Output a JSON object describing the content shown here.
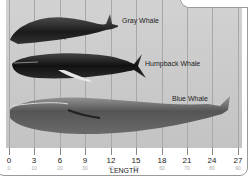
{
  "diagram": {
    "axis": {
      "title": "LENGTH",
      "meters": [
        "0",
        "3",
        "6",
        "9",
        "12",
        "15",
        "18",
        "21",
        "24",
        "27"
      ],
      "feet": [
        "0",
        "10",
        "20",
        "30",
        "40",
        "50",
        "60",
        "70",
        "80",
        "90"
      ]
    },
    "whales": [
      {
        "name": "Gray Whale",
        "approx_length_m": 14
      },
      {
        "name": "Humpback Whale",
        "approx_length_m": 16
      },
      {
        "name": "Blue Whale",
        "approx_length_m": 27
      }
    ]
  }
}
